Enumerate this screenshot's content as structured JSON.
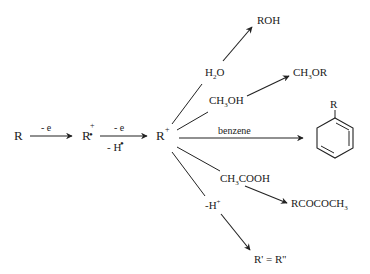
{
  "diagram": {
    "type": "reaction-scheme",
    "start": "R",
    "step1": {
      "label_above": "- e",
      "product": "R",
      "product_sup": "+",
      "product_dot": "•"
    },
    "step2": {
      "label_above": "- e",
      "label_below": "- H",
      "label_below_dot": "•",
      "product": "R",
      "product_sup": "+"
    },
    "branches": [
      {
        "reagent": "H",
        "reagent_sub": "2",
        "reagent_tail": "O",
        "product": "ROH"
      },
      {
        "reagent": "CH",
        "reagent_sub": "3",
        "reagent_tail": "OH",
        "product": "CH",
        "product_sub": "3",
        "product_tail": "OR"
      },
      {
        "reagent": "benzene",
        "product": "R",
        "product_type": "benzene-ring-with-R"
      },
      {
        "reagent": "CH",
        "reagent_sub": "3",
        "reagent_tail": "COOH",
        "product": "RCOCOCH",
        "product_sub": "3"
      },
      {
        "reagent": "-H",
        "reagent_sup": "+",
        "product": "R' = R''"
      }
    ],
    "colors": {
      "ink": "#222222",
      "background": "#ffffff"
    }
  }
}
